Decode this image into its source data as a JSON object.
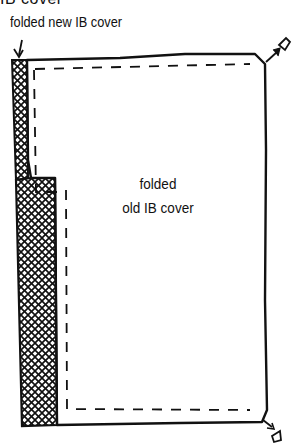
{
  "heading_partial": "IB cover",
  "labels": {
    "new_cover": "folded new IB cover",
    "old_cover_line1": "folded",
    "old_cover_line2": "old IB cover"
  },
  "icons": {
    "pointer_arrow": "arrow-down-icon",
    "top_right_arrow": "arrow-up-right-icon",
    "bottom_right_arrow": "arrow-down-right-icon"
  },
  "colors": {
    "ink": "#111111",
    "paper": "#ffffff"
  }
}
